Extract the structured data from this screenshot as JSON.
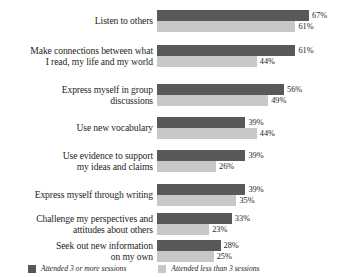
{
  "chart_data": {
    "type": "bar",
    "orientation": "horizontal",
    "title": "",
    "subtitle": "",
    "xlabel": "",
    "ylabel": "",
    "grid": false,
    "legend_position": "bottom",
    "value_suffix": "%",
    "xlim": [
      0,
      67
    ],
    "categories": [
      "Listen to others",
      "Make connections between what\nI read, my life and my world",
      "Express myself in group\ndiscussions",
      "Use new vocabulary",
      "Use evidence to support\nmy ideas and claims",
      "Express myself through writing",
      "Challenge my perspectives and\nattitudes about others",
      "Seek out new information\non my own"
    ],
    "series": [
      {
        "name": "Attended 3 or more sessions",
        "color": "#595959",
        "values": [
          67,
          61,
          56,
          39,
          39,
          39,
          33,
          28
        ],
        "labels": [
          "67%",
          "61%",
          "56%",
          "39%",
          "39%",
          "39%",
          "33%",
          "28%"
        ]
      },
      {
        "name": "Attended less than 3 sessions",
        "color": "#c8c8c8",
        "values": [
          61,
          44,
          49,
          44,
          26,
          35,
          23,
          25
        ],
        "labels": [
          "61%",
          "44%",
          "49%",
          "44%",
          "26%",
          "35%",
          "23%",
          "25%"
        ]
      }
    ]
  },
  "legend": {
    "items": [
      {
        "label": "Attended 3 or more sessions",
        "color": "#595959"
      },
      {
        "label": "Attended less than 3 sessions",
        "color": "#c8c8c8"
      }
    ]
  }
}
